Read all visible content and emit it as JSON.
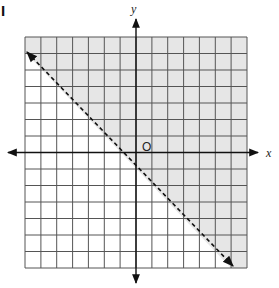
{
  "panel": {
    "label": "I"
  },
  "graph": {
    "type": "linear-inequality-graph",
    "x_axis_label": "x",
    "y_axis_label": "y",
    "origin_label": "O",
    "grid": {
      "columns": 14,
      "rows": 14,
      "x_range": [
        -7,
        7
      ],
      "y_range": [
        -7,
        7
      ]
    },
    "boundary_line": {
      "equation": "y = -x - 1",
      "style": "dashed",
      "from": [
        -7,
        6
      ],
      "to": [
        6,
        -7
      ]
    },
    "shaded_region": "above the line (contains origin)",
    "inequality": "y > -x - 1",
    "colors": {
      "shade": "#e6e6e6",
      "grid_line": "#555555",
      "axis": "#111111",
      "boundary": "#111111"
    }
  }
}
